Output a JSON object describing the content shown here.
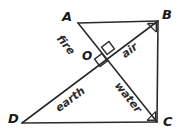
{
  "figure": {
    "stroke_color": "#2b2b2b",
    "background_color": "#ffffff",
    "vertices": [
      {
        "id": "A",
        "label": "A",
        "x": 78,
        "y": 23
      },
      {
        "id": "B",
        "label": "B",
        "x": 158,
        "y": 21
      },
      {
        "id": "C",
        "label": "C",
        "x": 157,
        "y": 122
      },
      {
        "id": "D",
        "label": "D",
        "x": 22,
        "y": 123
      },
      {
        "id": "O",
        "label": "O",
        "x": 100,
        "y": 53
      }
    ],
    "edges": [
      {
        "id": "AB",
        "from": "A",
        "to": "B"
      },
      {
        "id": "BC",
        "from": "B",
        "to": "C"
      },
      {
        "id": "DC",
        "from": "D",
        "to": "C"
      },
      {
        "id": "AD_diagonal_AC",
        "from": "A",
        "to": "C"
      },
      {
        "id": "diagonal_DB",
        "from": "D",
        "to": "B"
      }
    ],
    "right_angle_marks": [
      {
        "id": "angle-at-B",
        "at": "B"
      },
      {
        "id": "angle-at-C",
        "at": "C"
      },
      {
        "id": "angle-at-O-upper",
        "at": "O"
      },
      {
        "id": "angle-at-O-lower",
        "at": "O"
      }
    ],
    "region_labels": [
      {
        "id": "fire",
        "text": "fire",
        "rotation": 51,
        "x": 59,
        "y": 31
      },
      {
        "id": "air",
        "text": "air",
        "rotation": -37,
        "x": 123,
        "y": 50
      },
      {
        "id": "earth",
        "text": "earth",
        "rotation": -37,
        "x": 57,
        "y": 104
      },
      {
        "id": "water",
        "text": "water",
        "rotation": 51,
        "x": 117,
        "y": 78
      }
    ]
  }
}
